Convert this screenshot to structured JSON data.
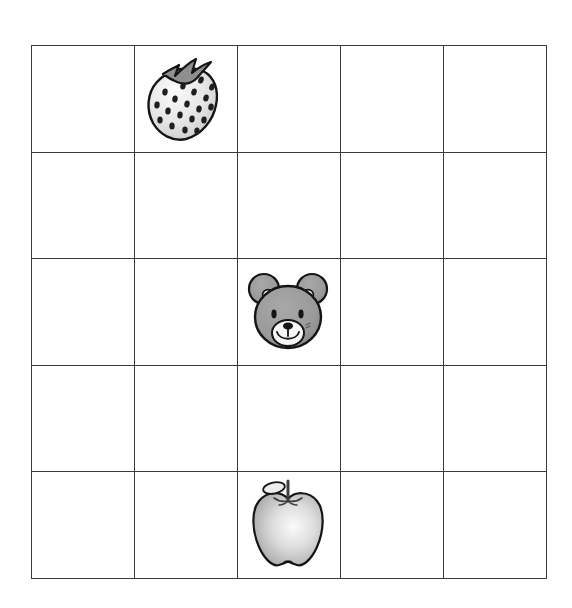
{
  "worksheet": {
    "title": "Picture Grid Worksheet",
    "grid": {
      "rows": 5,
      "columns": 5,
      "line_color": "#3a3a3a",
      "background_color": "#ffffff",
      "cell_width_px": 102,
      "cell_height_px": 105.6,
      "origin_x_px": 31,
      "origin_y_px": 45
    },
    "palette": {
      "outline": "#1a1a1a",
      "bear_fur": "#9a9a9a",
      "bear_fur_dark": "#7e7e7e",
      "bear_muzzle": "#f2f2f2",
      "berry_body": "#e4e4e4",
      "berry_seed": "#1f1f1f",
      "berry_calyx": "#8f8f8f",
      "apple_body": "#cfcfcf",
      "apple_highlight": "#f6f6f6",
      "apple_stem": "#4a4a4a"
    },
    "items": [
      {
        "name": "strawberry",
        "label": "Strawberry",
        "icon": "strawberry-icon",
        "row": 1,
        "column": 2
      },
      {
        "name": "bear",
        "label": "Teddy bear face",
        "icon": "bear-face-icon",
        "row": 3,
        "column": 3
      },
      {
        "name": "apple",
        "label": "Apple",
        "icon": "apple-icon",
        "row": 5,
        "column": 3
      }
    ],
    "cells": [
      [
        {
          "item": null
        },
        {
          "item": "strawberry"
        },
        {
          "item": null
        },
        {
          "item": null
        },
        {
          "item": null
        }
      ],
      [
        {
          "item": null
        },
        {
          "item": null
        },
        {
          "item": null
        },
        {
          "item": null
        },
        {
          "item": null
        }
      ],
      [
        {
          "item": null
        },
        {
          "item": null
        },
        {
          "item": "bear"
        },
        {
          "item": null
        },
        {
          "item": null
        }
      ],
      [
        {
          "item": null
        },
        {
          "item": null
        },
        {
          "item": null
        },
        {
          "item": null
        },
        {
          "item": null
        }
      ],
      [
        {
          "item": null
        },
        {
          "item": null
        },
        {
          "item": "apple"
        },
        {
          "item": null
        },
        {
          "item": null
        }
      ]
    ]
  }
}
